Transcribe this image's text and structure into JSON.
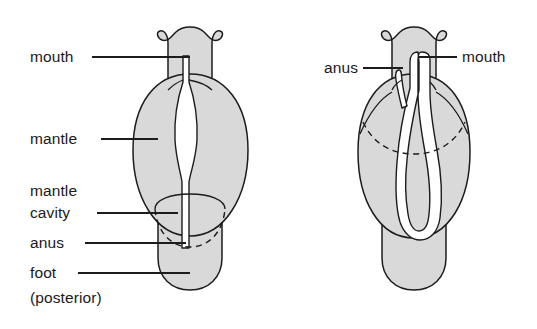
{
  "figure": {
    "background_color": "#ffffff",
    "body_fill_color": "#d9d9d9",
    "outline_color": "#1c1c1c",
    "lumen_fill_color": "#ffffff"
  },
  "left_diagram": {
    "name": "untorted-larva",
    "labels": [
      {
        "id": "mouth",
        "text": "mouth",
        "x": 30,
        "y": 62,
        "leader": true
      },
      {
        "id": "mantle",
        "text": "mantle",
        "x": 30,
        "y": 144,
        "leader": true
      },
      {
        "id": "mantle_line1",
        "text": "mantle",
        "x": 30,
        "y": 196,
        "leader": false
      },
      {
        "id": "mantle_line2",
        "text": "cavity",
        "x": 30,
        "y": 218,
        "leader": true
      },
      {
        "id": "anus",
        "text": "anus",
        "x": 30,
        "y": 248,
        "leader": true
      },
      {
        "id": "foot",
        "text": "foot",
        "x": 30,
        "y": 278,
        "leader": true
      },
      {
        "id": "posterior",
        "text": "(posterior)",
        "x": 30,
        "y": 303,
        "leader": false
      }
    ]
  },
  "right_diagram": {
    "name": "torted-larva",
    "labels": [
      {
        "id": "anus",
        "text": "anus",
        "x": 318,
        "y": 73,
        "leader": true,
        "anchor": "start"
      },
      {
        "id": "mouth",
        "text": "mouth",
        "x": 462,
        "y": 62,
        "leader": true,
        "anchor": "start"
      }
    ]
  }
}
